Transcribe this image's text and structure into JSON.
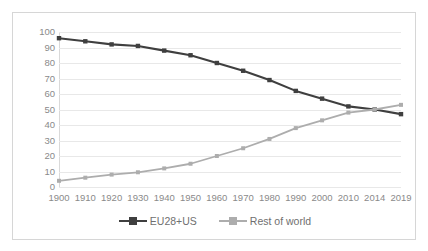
{
  "chart_data": {
    "type": "line",
    "title": "",
    "xlabel": "",
    "ylabel": "",
    "ylim": [
      0,
      100
    ],
    "ytick_step": 10,
    "grid": true,
    "legend_position": "bottom",
    "categories": [
      "1900",
      "1910",
      "1920",
      "1930",
      "1940",
      "1950",
      "1960",
      "1970",
      "1980",
      "1990",
      "2000",
      "2010",
      "2014",
      "2019"
    ],
    "yticks": [
      "100",
      "90",
      "80",
      "70",
      "60",
      "50",
      "40",
      "30",
      "20",
      "10",
      "0"
    ],
    "series": [
      {
        "name": "EU28+US",
        "color": "#3f3f3f",
        "marker": "square",
        "values": [
          96,
          94,
          92,
          91,
          88,
          85,
          80,
          75,
          69,
          62,
          57,
          52,
          50,
          47
        ]
      },
      {
        "name": "Rest of world",
        "color": "#adadad",
        "marker": "square",
        "values": [
          4,
          6,
          8,
          9.5,
          12,
          15,
          20,
          25,
          31,
          38,
          43,
          48,
          50,
          53
        ]
      }
    ]
  },
  "legend": {
    "items": [
      {
        "label": "EU28+US"
      },
      {
        "label": "Rest of world"
      }
    ]
  },
  "colors": {
    "series_dark": "#3f3f3f",
    "series_light": "#adadad",
    "gridline": "#e8e8e8",
    "border": "#d6d6d6",
    "tick_text": "#8a8a8a",
    "background": "#ffffff"
  }
}
